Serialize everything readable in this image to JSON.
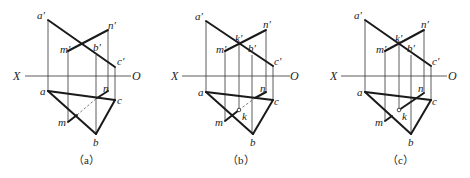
{
  "figure": {
    "panels": [
      {
        "id": "a",
        "caption": "（a）",
        "axis": {
          "x_label": "X",
          "o_label": "O"
        },
        "labels": {
          "a_prime": "a′",
          "b_prime": "b′",
          "c_prime": "c′",
          "m_prime": "m′",
          "n_prime": "n′",
          "a": "a",
          "b": "b",
          "c": "c",
          "m": "m",
          "n": "n"
        }
      },
      {
        "id": "b",
        "caption": "（b）",
        "axis": {
          "x_label": "X",
          "o_label": "O"
        },
        "labels": {
          "a_prime": "a′",
          "b_prime": "b′",
          "c_prime": "c′",
          "m_prime": "m′",
          "n_prime": "n′",
          "k_prime": "k′",
          "a": "a",
          "b": "b",
          "c": "c",
          "m": "m",
          "n": "n",
          "k": "k"
        }
      },
      {
        "id": "c",
        "caption": "（c）",
        "axis": {
          "x_label": "X",
          "o_label": "O"
        },
        "labels": {
          "a_prime": "a′",
          "b_prime": "b′",
          "c_prime": "c′",
          "m_prime": "m′",
          "n_prime": "n′",
          "k_prime": "k′",
          "a": "a",
          "b": "b",
          "c": "c",
          "m": "m",
          "n": "n",
          "k": "k"
        }
      }
    ]
  }
}
